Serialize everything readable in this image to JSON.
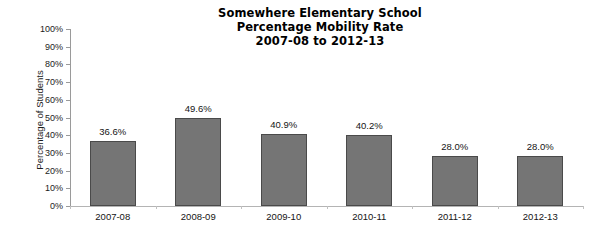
{
  "chart_data": {
    "type": "bar",
    "title": "Somewhere Elementary School\nPercentage Mobility Rate\n2007-08 to 2012-13",
    "title_lines": [
      "Somewhere Elementary School",
      "Percentage Mobility Rate",
      "2007-08 to 2012-13"
    ],
    "categories": [
      "2007-08",
      "2008-09",
      "2009-10",
      "2010-11",
      "2011-12",
      "2012-13"
    ],
    "values": [
      36.6,
      49.6,
      40.9,
      40.2,
      28.0,
      28.0
    ],
    "data_labels": [
      "36.6%",
      "49.6%",
      "40.9%",
      "40.2%",
      "28.0%",
      "28.0%"
    ],
    "xlabel": "",
    "ylabel": "Percentage of Students",
    "ylim": [
      0,
      100
    ],
    "ytick_values": [
      0,
      10,
      20,
      30,
      40,
      50,
      60,
      70,
      80,
      90,
      100
    ],
    "ytick_labels": [
      "0%",
      "10%",
      "20%",
      "30%",
      "40%",
      "50%",
      "60%",
      "70%",
      "80%",
      "90%",
      "100%"
    ],
    "grid": false,
    "legend": false,
    "bar_color": "#757575",
    "bar_border_color": "#4a4a4a",
    "axis_color": "#9a9a9a",
    "background": "#ffffff"
  }
}
